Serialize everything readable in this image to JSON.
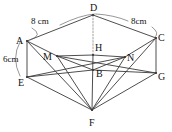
{
  "figure": {
    "stroke_color": "#3a3a3a",
    "background_color": "#ffffff",
    "label_color": "#111111",
    "vertices": [
      {
        "id": "A",
        "label": "A",
        "x": 27,
        "y": 41,
        "label_x": 16,
        "label_y": 36
      },
      {
        "id": "B",
        "label": "B",
        "x": 93,
        "y": 70,
        "label_x": 96,
        "label_y": 69
      },
      {
        "id": "C",
        "label": "C",
        "x": 156,
        "y": 38,
        "label_x": 158,
        "label_y": 33
      },
      {
        "id": "D",
        "label": "D",
        "x": 93,
        "y": 15,
        "label_x": 90,
        "label_y": 3
      },
      {
        "id": "E",
        "label": "E",
        "x": 27,
        "y": 77,
        "label_x": 18,
        "label_y": 78
      },
      {
        "id": "F",
        "label": "F",
        "x": 92,
        "y": 110,
        "label_x": 89,
        "label_y": 118
      },
      {
        "id": "G",
        "label": "G",
        "x": 156,
        "y": 73,
        "label_x": 158,
        "label_y": 72
      },
      {
        "id": "H",
        "label": "H",
        "x": 93,
        "y": 55,
        "label_x": 95,
        "label_y": 43
      },
      {
        "id": "M",
        "label": "M",
        "x": 57,
        "y": 56,
        "label_x": 43,
        "label_y": 52
      },
      {
        "id": "N",
        "label": "N",
        "x": 125,
        "y": 57,
        "label_x": 127,
        "label_y": 53
      }
    ],
    "solid_edges": [
      {
        "name": "A-D",
        "from": "A",
        "to": "D"
      },
      {
        "name": "D-C",
        "from": "D",
        "to": "C"
      },
      {
        "name": "A-M",
        "from": "A",
        "to": "M"
      },
      {
        "name": "M-H",
        "from": "M",
        "to": "H"
      },
      {
        "name": "H-N",
        "from": "H",
        "to": "N"
      },
      {
        "name": "N-C",
        "from": "N",
        "to": "C"
      },
      {
        "name": "A-E",
        "from": "A",
        "to": "E"
      },
      {
        "name": "C-G",
        "from": "C",
        "to": "G"
      },
      {
        "name": "E-F",
        "from": "E",
        "to": "F"
      },
      {
        "name": "F-G",
        "from": "F",
        "to": "G"
      },
      {
        "name": "E-B",
        "from": "E",
        "to": "B"
      },
      {
        "name": "B-G",
        "from": "B",
        "to": "G"
      },
      {
        "name": "M-B",
        "from": "M",
        "to": "B"
      },
      {
        "name": "B-N",
        "from": "B",
        "to": "N"
      },
      {
        "name": "H-F",
        "from": "H",
        "to": "F"
      },
      {
        "name": "M-F",
        "from": "M",
        "to": "F"
      },
      {
        "name": "N-F",
        "from": "N",
        "to": "F"
      },
      {
        "name": "E-N",
        "from": "E",
        "to": "N"
      },
      {
        "name": "M-G",
        "from": "M",
        "to": "G"
      },
      {
        "name": "A-F",
        "from": "A",
        "to": "F"
      },
      {
        "name": "C-F",
        "from": "C",
        "to": "F"
      }
    ],
    "dashed_edges": [
      {
        "name": "D-H",
        "from": "D",
        "to": "H"
      }
    ],
    "dimensions": [
      {
        "id": "dim-ad",
        "text": "8 cm",
        "label_x": 31,
        "label_y": 17,
        "leader_path": "M 32 28 Q 44 35 30 40",
        "arc_path": "M 60 25 Q 80 15 95 14"
      },
      {
        "id": "dim-dc",
        "text": "8cm",
        "label_x": 131,
        "label_y": 17,
        "leader_path": "M 152 27 Q 160 33 155 37",
        "arc_path": "M 96 14 Q 114 15 128 21"
      },
      {
        "id": "dim-ae",
        "text": "6cm",
        "label_x": 3,
        "label_y": 55,
        "leader_path": "M 20 42 Q 11 58 20 76",
        "arc_path": ""
      }
    ]
  }
}
